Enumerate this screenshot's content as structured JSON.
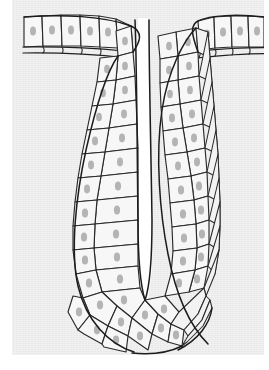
{
  "figure": {
    "caption": "",
    "width": 269,
    "height": 370,
    "background_color": "#ffffff",
    "plate_color": "#e9e9e9",
    "cell_fill_color": "#f7f7f7",
    "line_color": "#1c1c1c",
    "nucleus_color": "#9a9a9a",
    "lumen_color": "#ffffff"
  },
  "structures": {
    "surface_epithelium_left": {
      "label": "surface epithelium (left)",
      "cell_count": 6,
      "orientation": "horizontal"
    },
    "surface_epithelium_right": {
      "label": "surface epithelium (right)",
      "cell_count": 4,
      "orientation": "horizontal"
    },
    "basement_membrane": {
      "label": "basement membrane",
      "line_count": 2,
      "sides": [
        "left",
        "right"
      ]
    },
    "invagination_left_wall": {
      "label": "invagination left wall",
      "layers": 2,
      "cell_rows": 12
    },
    "invagination_right_wall": {
      "label": "invagination right wall",
      "layers": 3,
      "cell_rows": 12
    },
    "lumen": {
      "label": "lumen (narrow central cleft)",
      "top_y": 30,
      "bottom_y": 300
    },
    "invagination_tip": {
      "label": "rounded tip of invagination",
      "cell_count": 10
    },
    "mesenchyme": {
      "label": "surrounding mesenchyme / stroma"
    }
  },
  "legend": {
    "items": [
      {
        "name": "cell",
        "description": "columnar epithelial cell"
      },
      {
        "name": "nucleus",
        "description": "oval stippled nucleus"
      },
      {
        "name": "basement-membrane",
        "description": "paired basal line"
      },
      {
        "name": "lumen",
        "description": "central white cleft"
      }
    ]
  }
}
